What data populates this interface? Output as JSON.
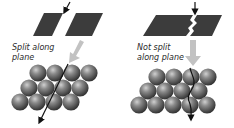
{
  "panels": [
    {
      "id": "split",
      "label_lines": [
        "Split along",
        "plane"
      ],
      "outcome": "cleaves cleanly along plane"
    },
    {
      "id": "not-split",
      "label_lines": [
        "Not split",
        "along plane"
      ],
      "outcome": "fracture does not follow plane"
    }
  ],
  "colors": {
    "plate": "#3c3c3c",
    "sphere_light": "#b5b5b5",
    "sphere_mid": "#6e6e6e",
    "sphere_dark": "#2e2e2e",
    "grey_arrow": "#bdbdbd",
    "black_arrow": "#111111"
  }
}
